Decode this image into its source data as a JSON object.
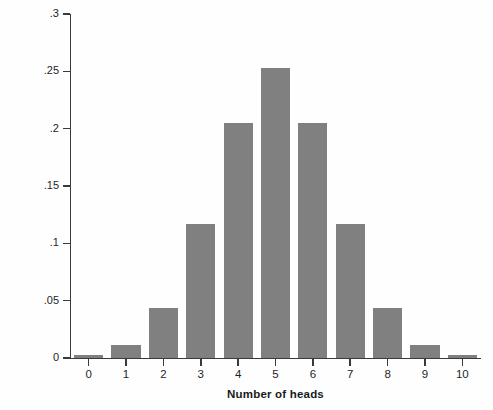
{
  "chart_data": {
    "type": "bar",
    "title": "",
    "subtitle": "",
    "xlabel": "Number of heads",
    "ylabel": "Probability",
    "categories": [
      "0",
      "1",
      "2",
      "3",
      "4",
      "5",
      "6",
      "7",
      "8",
      "9",
      "10"
    ],
    "values": [
      0.0029,
      0.0117,
      0.0439,
      0.1172,
      0.2051,
      0.2527,
      0.2051,
      0.1172,
      0.0439,
      0.0117,
      0.0029
    ],
    "ylim": [
      0,
      0.3
    ],
    "xlim": [
      -0.5,
      10.5
    ],
    "ytick_labels": [
      "0",
      ".05",
      ".1",
      ".15",
      ".2",
      ".25",
      ".3"
    ],
    "ytick_values": [
      0,
      0.05,
      0.1,
      0.15,
      0.2,
      0.25,
      0.3
    ],
    "grid": false,
    "legend": null,
    "legend_position": "none",
    "bar_color": "#808080",
    "axis_color": "#3a3a3a",
    "background_color": "#fefefe",
    "annotations": []
  }
}
